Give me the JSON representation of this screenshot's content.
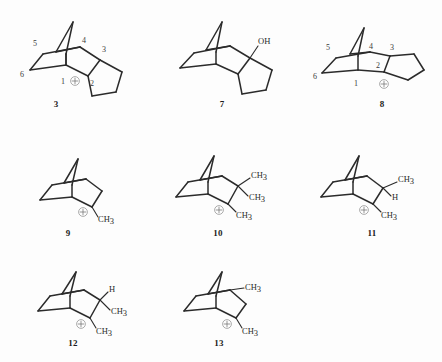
{
  "figure": {
    "background_color": "#fdfdfd",
    "bond_color": "#2b2b2b",
    "label_color": "#2a2a2a",
    "charge_symbol": "circled-plus"
  },
  "structures": [
    {
      "id": "structure-3",
      "caption": "3",
      "skeleton": "tricyclic-norbornyl-fused-cyclopentane",
      "numbering": [
        "1",
        "2",
        "3",
        "4",
        "5",
        "6"
      ],
      "charge": "+",
      "charge_position": "C2",
      "substituents": []
    },
    {
      "id": "structure-7",
      "caption": "7",
      "skeleton": "tricyclic-norbornyl-fused-cyclopentane",
      "numbering": [],
      "charge": "",
      "charge_position": "",
      "substituents": [
        "OH"
      ]
    },
    {
      "id": "structure-8",
      "caption": "8",
      "skeleton": "tricyclic-norbornyl-fused-cyclopentane-flat",
      "numbering": [
        "1",
        "2",
        "3",
        "4",
        "5",
        "6"
      ],
      "charge": "+",
      "charge_position": "C2",
      "substituents": []
    },
    {
      "id": "structure-9",
      "caption": "9",
      "skeleton": "norbornyl",
      "numbering": [],
      "charge": "+",
      "charge_position": "C2",
      "substituents": [
        "CH3"
      ]
    },
    {
      "id": "structure-10",
      "caption": "10",
      "skeleton": "norbornyl",
      "numbering": [],
      "charge": "+",
      "charge_position": "C2",
      "substituents": [
        "CH3",
        "CH3",
        "CH3"
      ]
    },
    {
      "id": "structure-11",
      "caption": "11",
      "skeleton": "norbornyl",
      "numbering": [],
      "charge": "+",
      "charge_position": "C2",
      "substituents": [
        "CH3",
        "H",
        "CH3"
      ]
    },
    {
      "id": "structure-12",
      "caption": "12",
      "skeleton": "norbornyl",
      "numbering": [],
      "charge": "+",
      "charge_position": "C2",
      "substituents": [
        "H",
        "CH3",
        "CH3"
      ]
    },
    {
      "id": "structure-13",
      "caption": "13",
      "skeleton": "norbornyl",
      "numbering": [],
      "charge": "+",
      "charge_position": "C2",
      "substituents": [
        "CH3",
        "CH3"
      ]
    }
  ],
  "labels": {
    "hydroxyl": "OH",
    "methyl_c": "CH",
    "methyl_sub": "3",
    "hydrogen": "H",
    "n1": "1",
    "n2": "2",
    "n3": "3",
    "n4": "4",
    "n5": "5",
    "n6": "6"
  },
  "captions": {
    "c3": "3",
    "c7": "7",
    "c8": "8",
    "c9": "9",
    "c10": "10",
    "c11": "11",
    "c12": "12",
    "c13": "13"
  }
}
